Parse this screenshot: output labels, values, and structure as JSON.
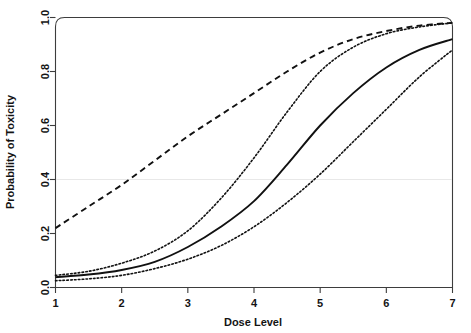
{
  "chart_data": {
    "type": "line",
    "title": "",
    "xlabel": "Dose Level",
    "ylabel": "Probability of Toxicity",
    "xlim": [
      1,
      7
    ],
    "ylim": [
      0.0,
      1.0
    ],
    "xticks": [
      1,
      2,
      3,
      4,
      5,
      6,
      7
    ],
    "xtick_labels": [
      "1",
      "2",
      "3",
      "4",
      "5",
      "6",
      "7"
    ],
    "yticks": [
      0.0,
      0.2,
      0.4,
      0.6,
      0.8,
      1.0
    ],
    "ytick_labels": [
      "0.0",
      "0.2",
      "0.4",
      "0.6",
      "0.8",
      "1.0"
    ],
    "grid": false,
    "legend": "none",
    "annotations": [
      {
        "name": "target-toxicity-line",
        "type": "hline",
        "y": 0.4,
        "color": "#e8e8e8"
      }
    ],
    "x": [
      1,
      1.5,
      2,
      2.5,
      3,
      3.5,
      4,
      4.5,
      5,
      5.5,
      6,
      6.5,
      7
    ],
    "series": [
      {
        "name": "Prior skeleton",
        "style": "dashed",
        "color": "#111111",
        "values": [
          0.22,
          0.3,
          0.38,
          0.47,
          0.56,
          0.64,
          0.72,
          0.8,
          0.87,
          0.92,
          0.95,
          0.97,
          0.98
        ]
      },
      {
        "name": "Upper credible bound",
        "style": "dotted",
        "color": "#111111",
        "values": [
          0.045,
          0.06,
          0.09,
          0.135,
          0.21,
          0.33,
          0.48,
          0.65,
          0.8,
          0.89,
          0.94,
          0.965,
          0.98
        ]
      },
      {
        "name": "Posterior mean",
        "style": "solid",
        "color": "#111111",
        "values": [
          0.038,
          0.048,
          0.065,
          0.095,
          0.15,
          0.225,
          0.32,
          0.455,
          0.6,
          0.72,
          0.815,
          0.88,
          0.92
        ]
      },
      {
        "name": "Lower credible bound",
        "style": "dotted",
        "color": "#111111",
        "values": [
          0.025,
          0.032,
          0.045,
          0.07,
          0.105,
          0.155,
          0.225,
          0.315,
          0.42,
          0.54,
          0.66,
          0.78,
          0.88
        ]
      }
    ]
  },
  "axes": {
    "x_title": "Dose Level",
    "y_title": "Probability of Toxicity"
  }
}
